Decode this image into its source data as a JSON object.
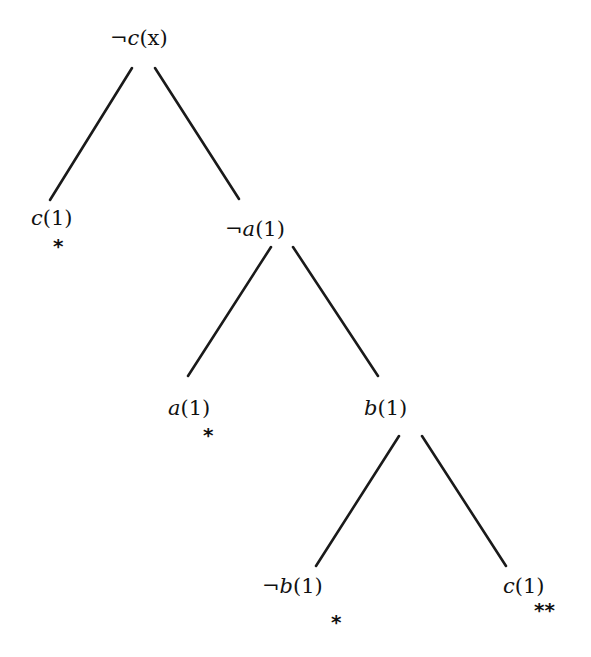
{
  "diagram": {
    "type": "tableau-tree",
    "line_color": "#1a1a1a",
    "text_color": "#111111",
    "background": "#ffffff",
    "nodes": [
      {
        "id": "root",
        "neg": "¬",
        "pred": "c",
        "arg": "(x)",
        "label": "¬c(x)",
        "mark": ""
      },
      {
        "id": "n1",
        "neg": "",
        "pred": "c",
        "arg": "(1)",
        "label": "c(1)",
        "mark": "*"
      },
      {
        "id": "n2",
        "neg": "¬",
        "pred": "a",
        "arg": "(1)",
        "label": "¬a(1)",
        "mark": ""
      },
      {
        "id": "n3",
        "neg": "",
        "pred": "a",
        "arg": "(1)",
        "label": "a(1)",
        "mark": "*"
      },
      {
        "id": "n4",
        "neg": "",
        "pred": "b",
        "arg": "(1)",
        "label": "b(1)",
        "mark": ""
      },
      {
        "id": "n5",
        "neg": "¬",
        "pred": "b",
        "arg": "(1)",
        "label": "¬b(1)",
        "mark": "*"
      },
      {
        "id": "n6",
        "neg": "",
        "pred": "c",
        "arg": "(1)",
        "label": "c(1)",
        "mark": "**"
      }
    ],
    "edges": [
      {
        "from": "root",
        "to": "n1"
      },
      {
        "from": "root",
        "to": "n2"
      },
      {
        "from": "n2",
        "to": "n3"
      },
      {
        "from": "n2",
        "to": "n4"
      },
      {
        "from": "n4",
        "to": "n5"
      },
      {
        "from": "n4",
        "to": "n6"
      }
    ]
  }
}
